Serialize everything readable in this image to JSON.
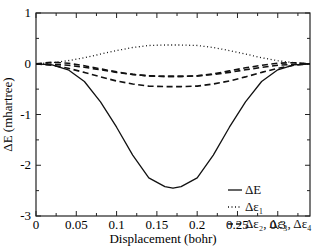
{
  "chart_data": {
    "type": "line",
    "title": "",
    "xlabel": "Displacement (bohr)",
    "ylabel": "ΔE (mhartree)",
    "xlim": [
      0,
      0.34
    ],
    "ylim": [
      -3,
      1
    ],
    "xticks": [
      "0",
      "0.05",
      "0.1",
      "0.15",
      "0.2",
      "0.25",
      "0.3"
    ],
    "yticks": [
      "1",
      "0",
      "-1",
      "-2",
      "-3"
    ],
    "grid": false,
    "legend_position": "lower right",
    "x": [
      0,
      0.02,
      0.04,
      0.06,
      0.08,
      0.1,
      0.12,
      0.14,
      0.16,
      0.17,
      0.18,
      0.2,
      0.22,
      0.24,
      0.26,
      0.28,
      0.3,
      0.32,
      0.34
    ],
    "series": [
      {
        "name": "ΔE",
        "style": "solid",
        "values": [
          0,
          -0.02,
          -0.12,
          -0.35,
          -0.75,
          -1.25,
          -1.8,
          -2.25,
          -2.42,
          -2.45,
          -2.42,
          -2.25,
          -1.8,
          -1.25,
          -0.75,
          -0.35,
          -0.12,
          -0.02,
          0
        ]
      },
      {
        "name": "Δε1",
        "style": "dotted",
        "values": [
          0,
          0.02,
          0.06,
          0.12,
          0.19,
          0.26,
          0.32,
          0.36,
          0.37,
          0.37,
          0.37,
          0.36,
          0.32,
          0.26,
          0.19,
          0.12,
          0.06,
          0.02,
          0
        ]
      },
      {
        "name": "Δε2",
        "style": "dashed",
        "values": [
          0,
          -0.01,
          -0.03,
          -0.07,
          -0.12,
          -0.17,
          -0.21,
          -0.24,
          -0.25,
          -0.25,
          -0.25,
          -0.24,
          -0.21,
          -0.17,
          -0.12,
          -0.07,
          -0.03,
          -0.01,
          0
        ]
      },
      {
        "name": "Δε3",
        "style": "dashed",
        "values": [
          0,
          0.03,
          0.01,
          -0.04,
          -0.1,
          -0.16,
          -0.21,
          -0.24,
          -0.25,
          -0.25,
          -0.25,
          -0.24,
          -0.2,
          -0.14,
          -0.08,
          -0.03,
          0.01,
          0.02,
          0
        ]
      },
      {
        "name": "Δε4",
        "style": "dashed",
        "values": [
          0,
          -0.03,
          -0.09,
          -0.17,
          -0.26,
          -0.34,
          -0.4,
          -0.44,
          -0.45,
          -0.45,
          -0.45,
          -0.44,
          -0.4,
          -0.34,
          -0.26,
          -0.17,
          -0.09,
          -0.03,
          0
        ]
      }
    ]
  },
  "legend": {
    "items": [
      {
        "label": "ΔE",
        "style": "solid"
      },
      {
        "label": "Δε₁",
        "style": "dotted"
      },
      {
        "label": "Δε₂,  Δε₃, Δε₄",
        "style": "dashed"
      }
    ]
  }
}
